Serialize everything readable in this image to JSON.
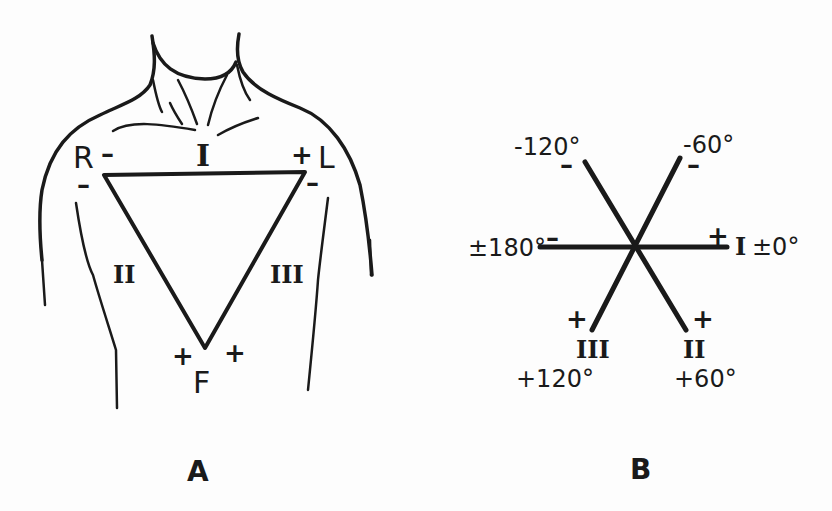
{
  "figure": {
    "panel_a": {
      "label": "A",
      "electrodes": {
        "right": "R",
        "left": "L",
        "foot": "F"
      },
      "leads": {
        "lead_1": "I",
        "lead_2": "II",
        "lead_3": "III"
      },
      "polarity": {
        "r_top": "–",
        "r_side": "–",
        "l_top": "+",
        "l_side": "–",
        "f_left": "+",
        "f_right": "+"
      }
    },
    "panel_b": {
      "label": "B",
      "axes": [
        {
          "name": "lead-I-positive",
          "angle": "±0°",
          "lead": "I",
          "sign": "+"
        },
        {
          "name": "lead-I-negative",
          "angle": "±180°",
          "sign": "–"
        },
        {
          "name": "lead-II-positive",
          "angle": "+60°",
          "lead": "II",
          "sign": "+"
        },
        {
          "name": "lead-II-negative",
          "angle": "-120°",
          "sign": "–"
        },
        {
          "name": "lead-III-positive",
          "angle": "+120°",
          "lead": "III",
          "sign": "+"
        },
        {
          "name": "lead-III-negative",
          "angle": "-60°",
          "sign": "–"
        }
      ]
    },
    "colors": {
      "ink": "#1a1a1a",
      "paper": "#fdfdfd"
    }
  }
}
